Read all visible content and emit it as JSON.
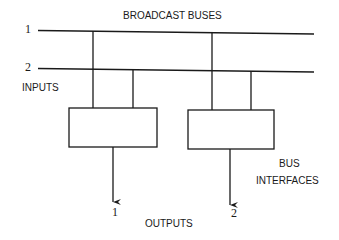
{
  "title": "BROADCAST BUSES",
  "buses": [
    {
      "id": "1",
      "label": "1"
    },
    {
      "id": "2",
      "label": "2"
    }
  ],
  "inputs_label": "INPUTS",
  "interfaces_label_line1": "BUS",
  "interfaces_label_line2": "INTERFACES",
  "outputs": [
    {
      "id": "1",
      "label": "1"
    },
    {
      "id": "2",
      "label": "2"
    }
  ],
  "outputs_label": "OUTPUTS",
  "colors": {
    "ink": "#1a1a1a",
    "background": "#ffffff"
  }
}
